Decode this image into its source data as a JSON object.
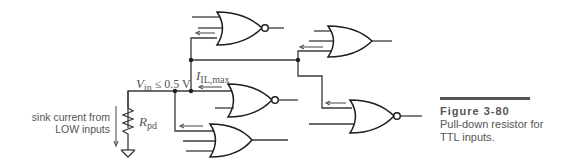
{
  "diagram": {
    "labels": {
      "vin_symbol": "V",
      "vin_sub": "in",
      "vin_condition": "≤ 0.5 V",
      "iil_symbol": "I",
      "iil_sub": "IL,max",
      "rpd_symbol": "R",
      "rpd_sub": "pd",
      "sink_line1": "sink current  from",
      "sink_line2": "LOW inputs"
    },
    "components": [
      {
        "type": "nor-gate",
        "id": "top-nor"
      },
      {
        "type": "or-gate",
        "id": "top-right-or"
      },
      {
        "type": "nor-gate",
        "id": "middle-nor"
      },
      {
        "type": "or-gate",
        "id": "bottom-or"
      },
      {
        "type": "nor-gate",
        "id": "right-nor"
      },
      {
        "type": "resistor",
        "id": "pull-down-resistor"
      },
      {
        "type": "ground",
        "id": "ground"
      }
    ],
    "colors": {
      "line": "#3a3a3a",
      "text": "#555555"
    }
  },
  "caption": {
    "title": "Figure 3-80",
    "line1": "Pull-down resistor for",
    "line2": "TTL inputs."
  }
}
